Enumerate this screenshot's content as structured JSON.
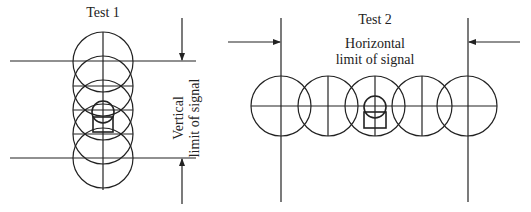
{
  "diagram": {
    "test1": {
      "title": "Test 1",
      "side_label_line1": "Vertical",
      "side_label_line2": "limit of signal",
      "orientation": "vertical",
      "circle_count": 5
    },
    "test2": {
      "title": "Test 2",
      "label_line1": "Horizontal",
      "label_line2": "limit of signal",
      "orientation": "horizontal",
      "circle_count": 5
    },
    "colors": {
      "line": "#222222",
      "background": "#ffffff"
    }
  }
}
